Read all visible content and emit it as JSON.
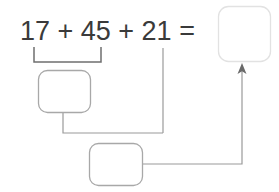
{
  "problem": {
    "equation_text": "17 + 45 + 21 =",
    "type": "multi-step-addition-worksheet",
    "terms": [
      "17",
      "45",
      "21"
    ],
    "operators": [
      "+",
      "+"
    ],
    "equals_sign": "=",
    "grouped_terms": [
      "17",
      "45"
    ]
  },
  "boxes": {
    "partial_sum_box": {
      "name": "first-partial-sum-box",
      "value": "",
      "placeholder": "",
      "border_color": "#a8a8a8",
      "fill_color": "#ffffff"
    },
    "second_sum_box": {
      "name": "second-partial-sum-box",
      "value": "",
      "placeholder": "",
      "border_color": "#a8a8a8",
      "fill_color": "#ffffff"
    },
    "answer_box": {
      "name": "final-answer-box",
      "value": "",
      "placeholder": "",
      "border_color": "#e2e2e2",
      "fill_color": "#ffffff"
    }
  },
  "connectors": {
    "bracket_label": "grouping-bracket-17-plus-45",
    "line_from_term_21": "drop-line-from-21",
    "line_box1_to_junction": "connector-partial-sum-to-second-box",
    "line_box2_to_answer": "connector-second-box-to-answer",
    "arrow_direction": "up",
    "stroke_color": "#9a9a9a"
  },
  "colors": {
    "background": "#ffffff",
    "text": "#3a3a3a",
    "line": "#9a9a9a",
    "bracket": "#6f6f6f",
    "box_border": "#a8a8a8",
    "box_border_faint": "#e2e2e2",
    "arrow": "#6a6a6a"
  }
}
